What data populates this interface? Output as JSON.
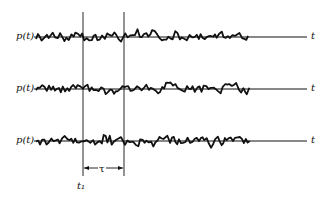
{
  "figure": {
    "y_label": "p(t)",
    "x_label": "t",
    "t1_label": "t₁",
    "tau_label": "τ",
    "colors": {
      "ink": "#111111",
      "background": "#ffffff"
    }
  },
  "records": [
    {
      "label": "p(t)",
      "axis_label": "t",
      "baseline_y": 37
    },
    {
      "label": "p(t)",
      "axis_label": "t",
      "baseline_y": 89
    },
    {
      "label": "p(t)",
      "axis_label": "t",
      "baseline_y": 141
    }
  ],
  "markers": {
    "t1_x": 83,
    "t1_plus_tau_x": 124
  },
  "layout": {
    "wave_start_x": 36,
    "wave_end_x": 250,
    "axis_start_x": 34,
    "axis_end_x": 307
  }
}
